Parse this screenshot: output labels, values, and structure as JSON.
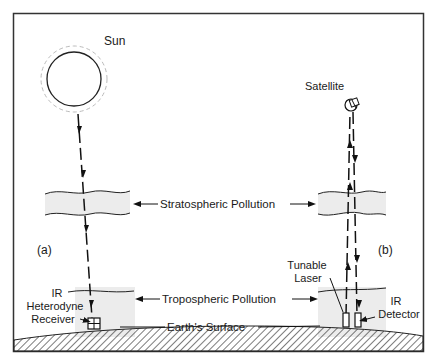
{
  "diagram": {
    "labels": {
      "sun": "Sun",
      "satellite": "Satellite",
      "stratospheric": "Stratospheric Pollution",
      "tropospheric": "Tropospheric Pollution",
      "earth": "Earth's Surface",
      "panel_a": "(a)",
      "panel_b": "(b)",
      "ir_receiver_1": "IR",
      "ir_receiver_2": "Heterodyne",
      "ir_receiver_3": "Receiver",
      "laser_1": "Tunable",
      "laser_2": "Laser",
      "detector_1": "IR",
      "detector_2": "Detector"
    },
    "colors": {
      "line": "#1a1a1a",
      "haze": "#e8e8e8",
      "frame": "#333333"
    }
  }
}
